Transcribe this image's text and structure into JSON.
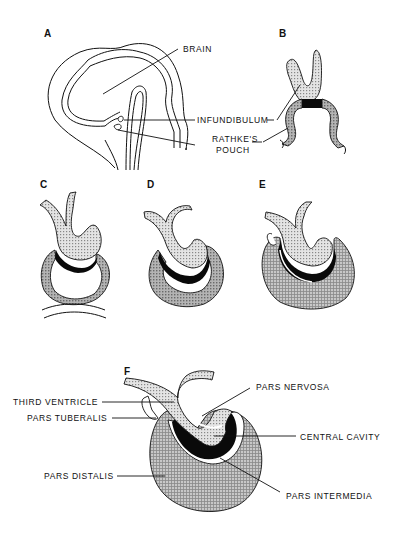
{
  "figure": {
    "panels": {
      "a": {
        "letter": "A",
        "labels": {
          "brain": "BRAIN",
          "infundibulum": "INFUNDIBULUM",
          "rathkes_pouch_1": "RATHKE'S",
          "rathkes_pouch_2": "POUCH"
        }
      },
      "b": {
        "letter": "B"
      },
      "c": {
        "letter": "C"
      },
      "d": {
        "letter": "D"
      },
      "e": {
        "letter": "E"
      },
      "f": {
        "letter": "F",
        "labels": {
          "third_ventricle": "THIRD  VENTRICLE",
          "pars_tuberalis": "PARS  TUBERALIS",
          "pars_nervosa": "PARS  NERVOSA",
          "central_cavity": "CENTRAL  CAVITY",
          "pars_distalis": "PARS  DISTALIS",
          "pars_intermedia": "PARS  INTERMEDIA"
        }
      }
    },
    "colors": {
      "ink": "#111111",
      "light_stipple": "#d6d6d6",
      "dark_stipple": "#a8a8a8",
      "black": "#0a0a0a"
    }
  }
}
